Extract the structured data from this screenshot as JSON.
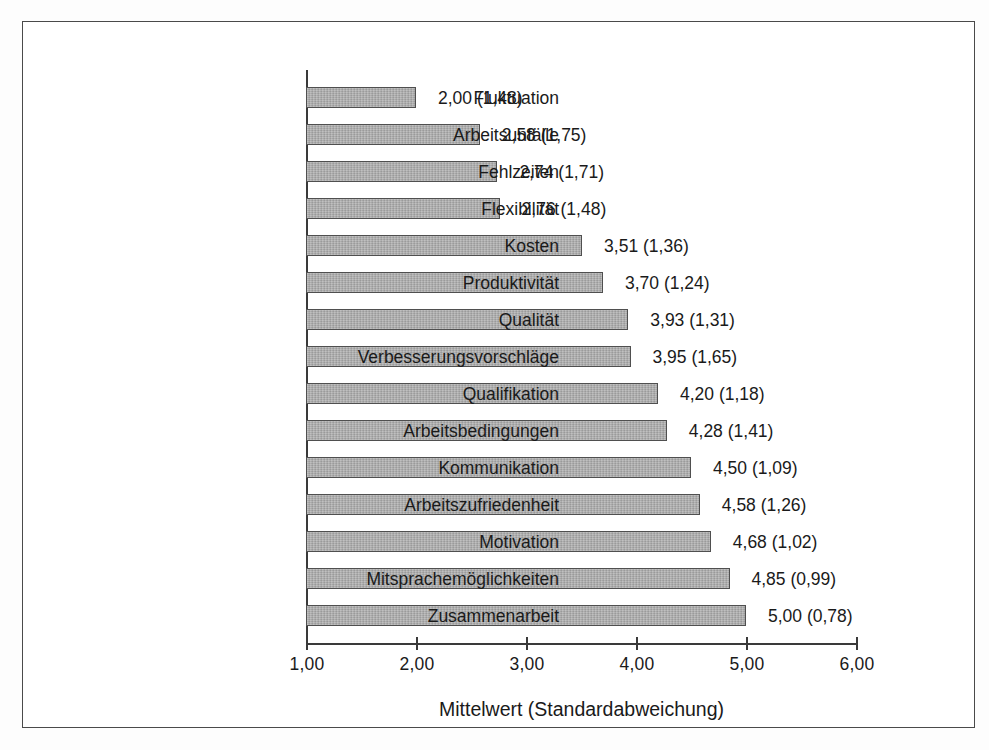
{
  "chart_data": {
    "type": "bar",
    "orientation": "horizontal",
    "title": "",
    "xlabel": "Mittelwert (Standardabweichung)",
    "ylabel": "",
    "xlim": [
      1.0,
      6.0
    ],
    "xticks": [
      "1,00",
      "2,00",
      "3,00",
      "4,00",
      "5,00",
      "6,00"
    ],
    "xtick_values": [
      1.0,
      2.0,
      3.0,
      4.0,
      5.0,
      6.0
    ],
    "grid": false,
    "legend": "none",
    "bar_color": "#a9a9a9",
    "bar_edge_color": "#4f4f4f",
    "categories": [
      "Fluktuation",
      "Arbeitsunfälle",
      "Fehlzeiten",
      "Flexibilität",
      "Kosten",
      "Produktivität",
      "Qualität",
      "Verbesserungsvorschläge",
      "Qualifikation",
      "Arbeitsbedingungen",
      "Kommunikation",
      "Arbeitszufriedenheit",
      "Motivation",
      "Mitsprachemöglichkeiten",
      "Zusammenarbeit"
    ],
    "values": [
      2.0,
      2.58,
      2.74,
      2.76,
      3.51,
      3.7,
      3.93,
      3.95,
      4.2,
      4.28,
      4.5,
      4.58,
      4.68,
      4.85,
      5.0
    ],
    "std_devs": [
      1.48,
      1.75,
      1.71,
      1.48,
      1.36,
      1.24,
      1.31,
      1.65,
      1.18,
      1.41,
      1.09,
      1.26,
      1.02,
      0.99,
      0.78
    ],
    "data_labels": [
      "2,00 (1,48)",
      "2,58 (1,75)",
      "2,74 (1,71)",
      "2,76 (1,48)",
      "3,51 (1,36)",
      "3,70 (1,24)",
      "3,93 (1,31)",
      "3,95 (1,65)",
      "4,20 (1,18)",
      "4,28 (1,41)",
      "4,50 (1,09)",
      "4,58 (1,26)",
      "4,68 (1,02)",
      "4,85 (0,99)",
      "5,00 (0,78)"
    ]
  }
}
